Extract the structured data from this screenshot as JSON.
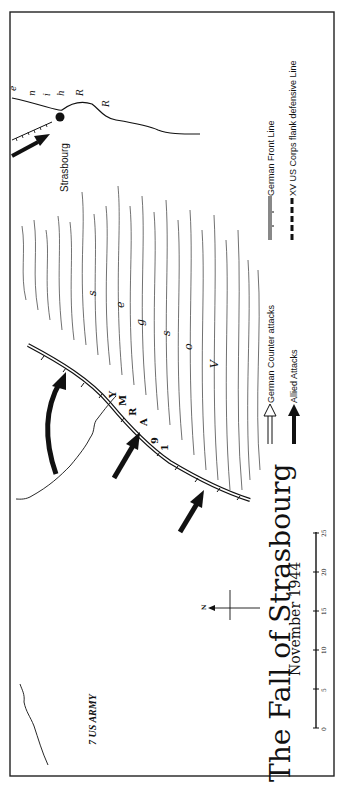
{
  "map": {
    "title": "The Fall of Strasbourg",
    "subtitle": "November 1944",
    "orientation": "rotated 90° counter-clockwise",
    "colors": {
      "ink": "#111111",
      "paper": "#ffffff"
    }
  },
  "labels": {
    "city": "Strasbourg",
    "river_letters": [
      "R",
      "R",
      "h",
      "i",
      "n",
      "e"
    ],
    "mountain_letters": [
      "V",
      "o",
      "s",
      "g",
      "e",
      "s"
    ],
    "army_19_letters": [
      "1",
      "9",
      "A",
      "R",
      "M",
      "Y"
    ],
    "army_7": "7 US ARMY",
    "north": "N"
  },
  "legend": {
    "items": [
      {
        "symbol": "hollow-arrow",
        "label": "German Counter attacks"
      },
      {
        "symbol": "solid-arrow",
        "label": "Allied Attacks"
      },
      {
        "symbol": "front-line",
        "label": "German Front Line"
      },
      {
        "symbol": "dashed-line",
        "label": "XV US  Corps flank defensive  Line"
      }
    ]
  },
  "scale_bar": {
    "ticks": [
      "0",
      "5",
      "10",
      "15",
      "20",
      "25"
    ]
  }
}
